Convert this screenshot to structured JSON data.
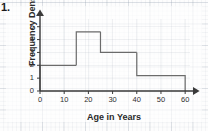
{
  "question_number": "1.",
  "chart_data": {
    "type": "bar",
    "title": "",
    "subtitle": "",
    "xlabel": "Age in Years",
    "ylabel": "Frequency Density",
    "xlim": [
      0,
      62
    ],
    "ylim": [
      0,
      5.6
    ],
    "grid": true,
    "legend": null,
    "axis_style": "arrowed",
    "xticks": [
      "0",
      "10",
      "20",
      "30",
      "40",
      "50",
      "60"
    ],
    "xtick_values": [
      0,
      10,
      20,
      30,
      40,
      50,
      60
    ],
    "yticks": [
      "0",
      "1",
      "2",
      "3",
      "4",
      "5"
    ],
    "ytick_values": [
      0,
      1,
      2,
      3,
      4,
      5
    ],
    "bin_edges": [
      0,
      15,
      25,
      40,
      60
    ],
    "categories": [
      "0-15",
      "15-25",
      "25-40",
      "40-60"
    ],
    "values": [
      2,
      4.6,
      3,
      1.2
    ],
    "bars": [
      {
        "label": "0-15",
        "x0": 0,
        "x1": 15,
        "height": 2
      },
      {
        "label": "15-25",
        "x0": 15,
        "x1": 25,
        "height": 4.6
      },
      {
        "label": "25-40",
        "x0": 25,
        "x1": 40,
        "height": 3
      },
      {
        "label": "40-60",
        "x0": 40,
        "x1": 60,
        "height": 1.2
      }
    ],
    "colors": {
      "bar_outline": "#6b6b6b",
      "axis": "#3a3a3a",
      "grid_major": "#96a0af",
      "grid_minor": "#aab4c3",
      "text": "#2a2a2a",
      "page": "#fdfdfd"
    }
  }
}
